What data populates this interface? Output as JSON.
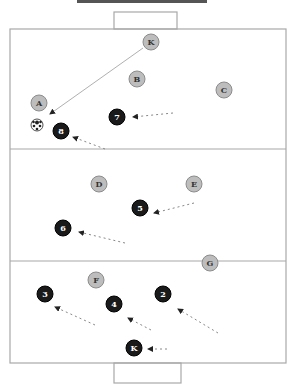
{
  "diagram": {
    "colors": {
      "field_line": "#a8a8a8",
      "opponent_fill": "#bdbdbd",
      "opponent_stroke": "#8c8c8c",
      "opponent_text": "#333333",
      "team_fill": "#1a1a1a",
      "team_text": "#ffffff",
      "pass_line": "#b0b0b0",
      "run_line": "#888888"
    },
    "field": {
      "x": 10,
      "y": 29,
      "width": 276,
      "height": 334
    },
    "lines": [
      {
        "y": 149
      },
      {
        "y": 261
      }
    ],
    "goals": [
      {
        "name": "top-goal",
        "x": 114,
        "y": 12,
        "width": 63,
        "height": 17
      },
      {
        "name": "bottom-goal",
        "x": 114,
        "y": 363,
        "width": 67,
        "height": 20
      }
    ],
    "opponents": [
      {
        "label": "K",
        "x": 151,
        "y": 42
      },
      {
        "label": "B",
        "x": 137,
        "y": 79
      },
      {
        "label": "C",
        "x": 224,
        "y": 90
      },
      {
        "label": "A",
        "x": 39,
        "y": 103
      },
      {
        "label": "D",
        "x": 99,
        "y": 184
      },
      {
        "label": "E",
        "x": 194,
        "y": 184
      },
      {
        "label": "G",
        "x": 210,
        "y": 263
      },
      {
        "label": "F",
        "x": 96,
        "y": 280
      }
    ],
    "team": [
      {
        "label": "7",
        "x": 117,
        "y": 117
      },
      {
        "label": "8",
        "x": 61,
        "y": 131
      },
      {
        "label": "5",
        "x": 140,
        "y": 208
      },
      {
        "label": "6",
        "x": 63,
        "y": 228
      },
      {
        "label": "3",
        "x": 45,
        "y": 294
      },
      {
        "label": "2",
        "x": 163,
        "y": 294
      },
      {
        "label": "4",
        "x": 114,
        "y": 304
      },
      {
        "label": "K",
        "x": 134,
        "y": 348
      }
    ],
    "ball": {
      "x": 37,
      "y": 125
    },
    "pass": {
      "from": [
        143,
        48
      ],
      "to": [
        50,
        114
      ]
    },
    "runs": [
      {
        "from": [
          173,
          113
        ],
        "to": [
          133,
          117
        ]
      },
      {
        "from": [
          105,
          149
        ],
        "to": [
          73,
          137
        ]
      },
      {
        "from": [
          194,
          203
        ],
        "to": [
          154,
          213
        ]
      },
      {
        "from": [
          125,
          243
        ],
        "to": [
          79,
          232
        ]
      },
      {
        "from": [
          95,
          325
        ],
        "to": [
          55,
          307
        ]
      },
      {
        "from": [
          151,
          330
        ],
        "to": [
          128,
          318
        ]
      },
      {
        "from": [
          218,
          333
        ],
        "to": [
          178,
          309
        ]
      },
      {
        "from": [
          167,
          349
        ],
        "to": [
          148,
          349
        ]
      }
    ]
  }
}
